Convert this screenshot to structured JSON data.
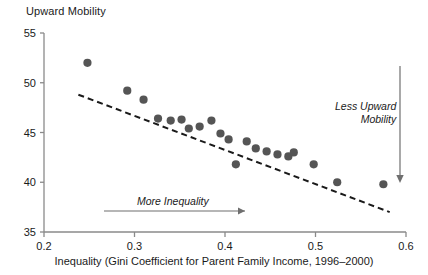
{
  "chart_data": {
    "type": "scatter",
    "title": "",
    "ylabel": "Upward Mobility",
    "xlabel": "Inequality (Gini Coefficient for Parent Family Income, 1996–2000)",
    "xlim": [
      0.2,
      0.6
    ],
    "ylim": [
      35,
      55
    ],
    "xticks": [
      "0.2",
      "0.3",
      "0.4",
      "0.5",
      "0.6"
    ],
    "xtick_values": [
      0.2,
      0.3,
      0.4,
      0.5,
      0.6
    ],
    "yticks": [
      "35",
      "40",
      "45",
      "50",
      "55"
    ],
    "ytick_values": [
      35,
      40,
      45,
      50,
      55
    ],
    "grid": false,
    "legend": "none",
    "points": [
      {
        "x": 0.248,
        "y": 52.0
      },
      {
        "x": 0.292,
        "y": 49.2
      },
      {
        "x": 0.31,
        "y": 48.3
      },
      {
        "x": 0.326,
        "y": 46.4
      },
      {
        "x": 0.34,
        "y": 46.2
      },
      {
        "x": 0.352,
        "y": 46.3
      },
      {
        "x": 0.36,
        "y": 45.4
      },
      {
        "x": 0.372,
        "y": 45.6
      },
      {
        "x": 0.385,
        "y": 46.2
      },
      {
        "x": 0.395,
        "y": 44.9
      },
      {
        "x": 0.404,
        "y": 44.3
      },
      {
        "x": 0.412,
        "y": 41.8
      },
      {
        "x": 0.424,
        "y": 44.1
      },
      {
        "x": 0.434,
        "y": 43.4
      },
      {
        "x": 0.446,
        "y": 43.1
      },
      {
        "x": 0.458,
        "y": 42.8
      },
      {
        "x": 0.47,
        "y": 42.6
      },
      {
        "x": 0.476,
        "y": 43.0
      },
      {
        "x": 0.498,
        "y": 41.8
      },
      {
        "x": 0.524,
        "y": 40.0
      },
      {
        "x": 0.575,
        "y": 39.8
      }
    ],
    "trendline": {
      "style": "dashed",
      "x_start": 0.238,
      "y_start": 48.8,
      "x_end": 0.582,
      "y_end": 37.0
    },
    "annotations": [
      {
        "id": "more-inequality",
        "text": "More Inequality",
        "arrow": "right"
      },
      {
        "id": "less-upward-mobility",
        "line1": "Less Upward",
        "line2": "Mobility",
        "arrow": "down"
      }
    ],
    "marker": {
      "color": "#555555",
      "size": 6,
      "shape": "circle"
    },
    "axis_color": "#8a8a8a"
  }
}
